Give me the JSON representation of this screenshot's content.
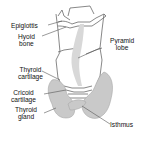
{
  "diagram": {
    "colors": {
      "gland_fill": "#c9c9c9",
      "gland_stroke": "#a8a8a8",
      "outline": "#6a6a6a",
      "leader": "#555555",
      "text": "#111111"
    },
    "labels": {
      "epiglottis": [
        "Epiglottis"
      ],
      "hyoid_bone": [
        "Hyoid",
        "bone"
      ],
      "thyroid_cartilage": [
        "Thyroid",
        "cartilage"
      ],
      "cricoid_cartilage": [
        "Cricoid",
        "cartilage"
      ],
      "thyroid_gland": [
        "Thyroid",
        "gland"
      ],
      "pyramidal_lobe": [
        "Pyramid",
        "lobe"
      ],
      "isthmus": [
        "Isthmus"
      ]
    }
  }
}
